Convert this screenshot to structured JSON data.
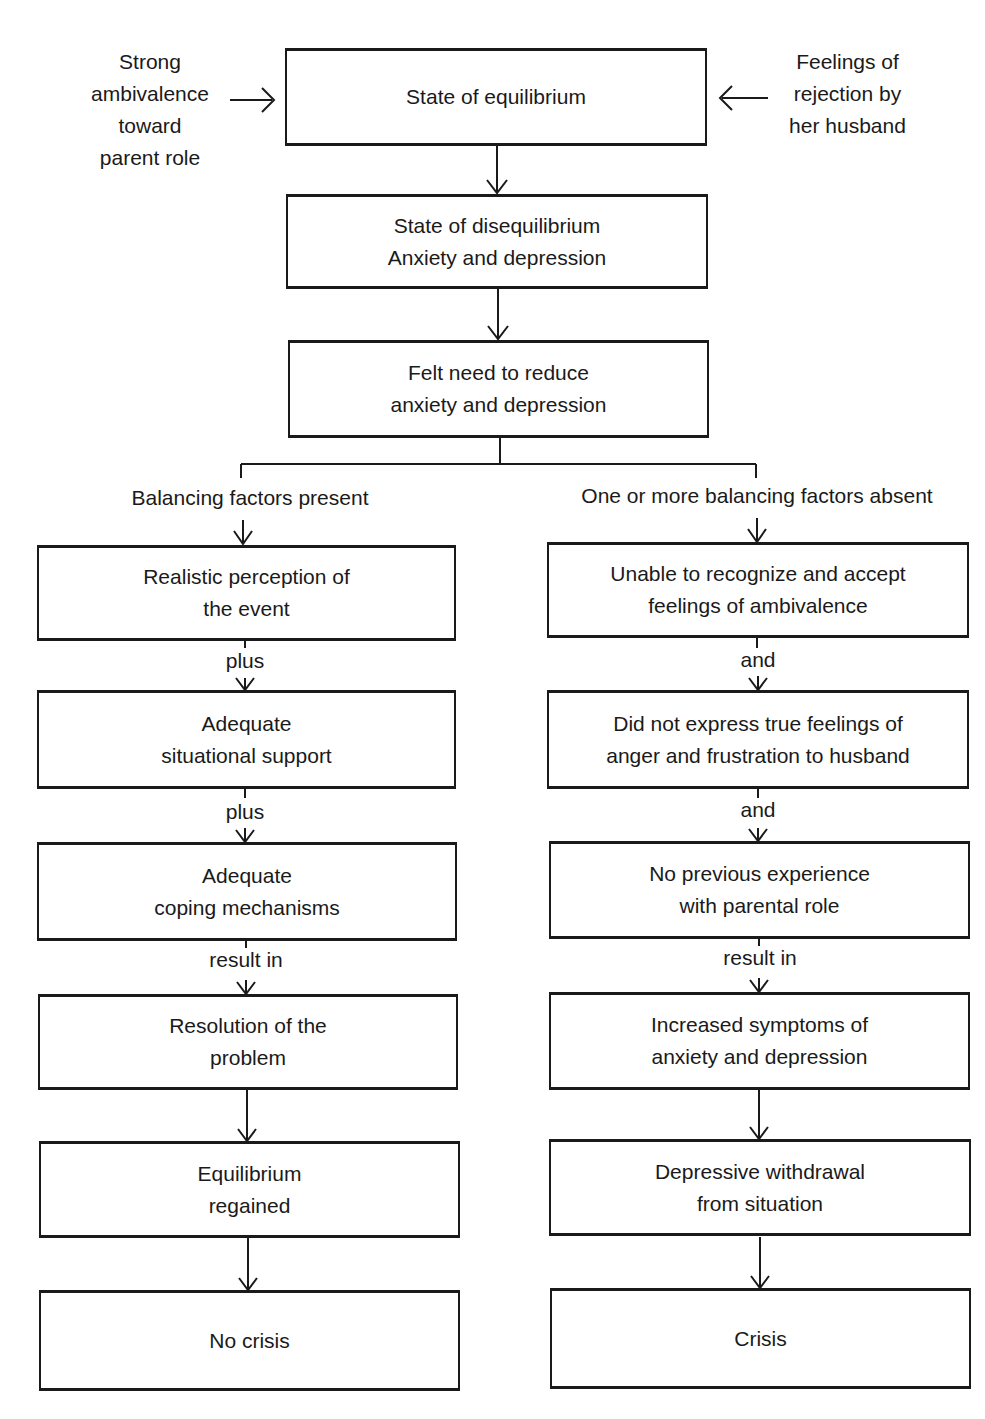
{
  "side_inputs": {
    "left": [
      "Strong",
      "ambivalence",
      "toward",
      "parent role"
    ],
    "right": [
      "Feelings of",
      "rejection by",
      "her husband"
    ]
  },
  "top_boxes": [
    {
      "lines": [
        "State of equilibrium"
      ]
    },
    {
      "lines": [
        "State of disequilibrium",
        "Anxiety and depression"
      ]
    },
    {
      "lines": [
        "Felt need to reduce",
        "anxiety and depression"
      ]
    }
  ],
  "branches": {
    "left": {
      "heading": "Balancing factors present",
      "boxes": [
        {
          "lines": [
            "Realistic perception of",
            "the event"
          ]
        },
        {
          "lines": [
            "Adequate",
            "situational support"
          ]
        },
        {
          "lines": [
            "Adequate",
            "coping mechanisms"
          ]
        },
        {
          "lines": [
            "Resolution of the",
            "problem"
          ]
        },
        {
          "lines": [
            "Equilibrium",
            "regained"
          ]
        },
        {
          "lines": [
            "No crisis"
          ]
        }
      ],
      "connectors": [
        "plus",
        "plus",
        "result in"
      ]
    },
    "right": {
      "heading": "One or more balancing factors absent",
      "boxes": [
        {
          "lines": [
            "Unable to recognize and accept",
            "feelings of ambivalence"
          ]
        },
        {
          "lines": [
            "Did not express true feelings of",
            "anger and frustration to husband"
          ]
        },
        {
          "lines": [
            "No previous experience",
            "with parental role"
          ]
        },
        {
          "lines": [
            "Increased symptoms of",
            "anxiety and depression"
          ]
        },
        {
          "lines": [
            "Depressive withdrawal",
            "from situation"
          ]
        },
        {
          "lines": [
            "Crisis"
          ]
        }
      ],
      "connectors": [
        "and",
        "and",
        "result in"
      ]
    }
  }
}
